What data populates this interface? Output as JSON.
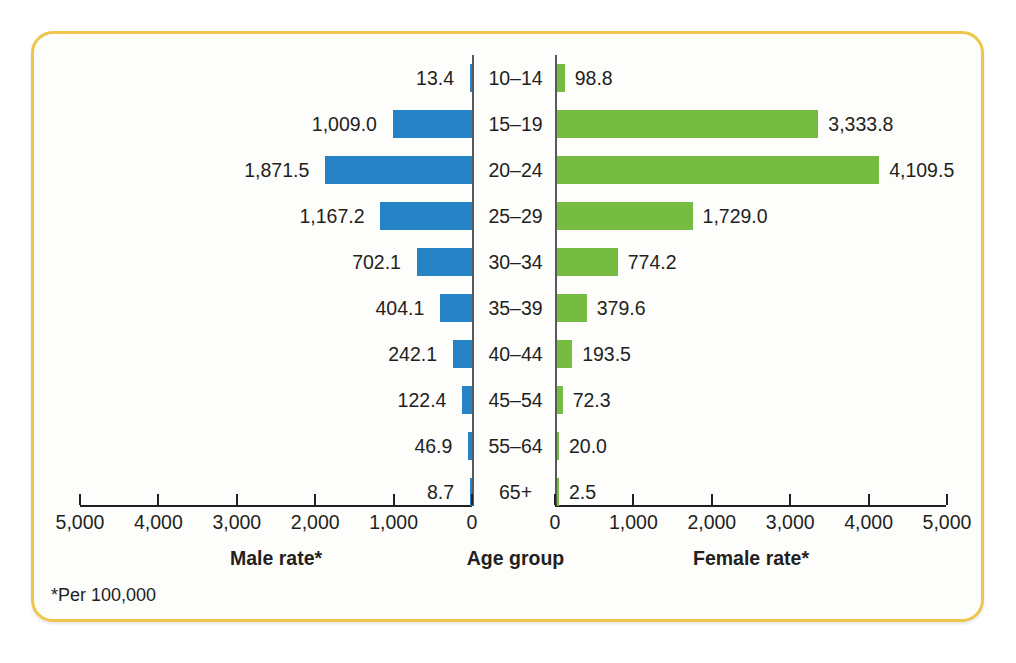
{
  "figure": {
    "footnote": "*Per 100,000",
    "accent_border_color": "#edc64b",
    "male_color": "#2583c6",
    "female_color": "#76bc43"
  },
  "axes": {
    "left": {
      "title": "Male rate*",
      "ticks": [
        "5,000",
        "4,000",
        "3,000",
        "2,000",
        "1,000",
        "0"
      ],
      "range": [
        5000,
        0
      ]
    },
    "center": {
      "title": "Age group"
    },
    "right": {
      "title": "Female rate*",
      "ticks": [
        "0",
        "1,000",
        "2,000",
        "3,000",
        "4,000",
        "5,000"
      ],
      "range": [
        0,
        5000
      ]
    }
  },
  "chart_data": {
    "type": "bar",
    "title": "",
    "subtitle": "",
    "xlabel": "Rate per 100,000",
    "ylabel": "Age group",
    "xlim": [
      0,
      5000
    ],
    "grid": false,
    "legend_position": "none",
    "orientation": "horizontal-diverging-pyramid",
    "categories": [
      "10–14",
      "15–19",
      "20–24",
      "25–29",
      "30–34",
      "35–39",
      "40–44",
      "45–54",
      "55–64",
      "65+"
    ],
    "series": [
      {
        "name": "Male rate*",
        "color": "#2583c6",
        "side": "left",
        "values": [
          13.4,
          1009.0,
          1871.5,
          1167.2,
          702.1,
          404.1,
          242.1,
          122.4,
          46.9,
          8.7
        ],
        "labels": [
          "13.4",
          "1,009.0",
          "1,871.5",
          "1,167.2",
          "702.1",
          "404.1",
          "242.1",
          "122.4",
          "46.9",
          "8.7"
        ]
      },
      {
        "name": "Female rate*",
        "color": "#76bc43",
        "side": "right",
        "values": [
          98.8,
          3333.8,
          4109.5,
          1729.0,
          774.2,
          379.6,
          193.5,
          72.3,
          20.0,
          2.5
        ],
        "labels": [
          "98.8",
          "3,333.8",
          "4,109.5",
          "1,729.0",
          "774.2",
          "379.6",
          "193.5",
          "72.3",
          "20.0",
          "2.5"
        ]
      }
    ],
    "annotations": [
      "*Per 100,000"
    ]
  }
}
